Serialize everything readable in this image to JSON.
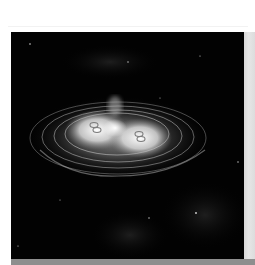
{
  "image": {
    "subject": "interacting galaxies with concentric elliptical shells on black starfield",
    "alt": "Astronomical image of two bright galaxy cores surrounded by concentric elliptical rings",
    "colors": {
      "background_page": "#ffffff",
      "sky": "#020202",
      "glow": "#ffffff",
      "frame_right": "#dcdcdc",
      "frame_bottom": "#8e8e8e"
    },
    "features": {
      "left_nucleus": {
        "x": 95,
        "y": 127
      },
      "right_nucleus": {
        "x": 139,
        "y": 136
      },
      "central_core": {
        "x": 115,
        "y": 128
      },
      "plume": {
        "x": 115,
        "y": 105
      },
      "stars": [
        {
          "x": 196,
          "y": 213
        },
        {
          "x": 149,
          "y": 218
        },
        {
          "x": 30,
          "y": 44
        },
        {
          "x": 128,
          "y": 62
        },
        {
          "x": 200,
          "y": 56
        },
        {
          "x": 238,
          "y": 162
        },
        {
          "x": 18,
          "y": 246
        }
      ]
    }
  }
}
